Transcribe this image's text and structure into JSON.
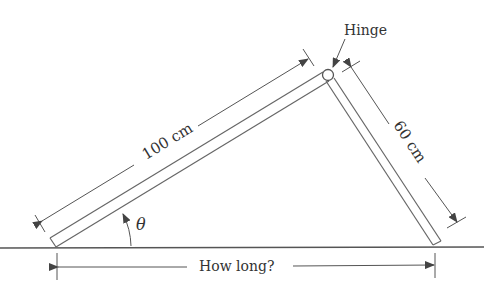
{
  "labels": {
    "hinge": "Hinge",
    "board_long": "100 cm",
    "board_short": "60 cm",
    "angle": "θ",
    "base": "How long?"
  },
  "colors": {
    "line": "#555555",
    "text": "#333333",
    "background": "#ffffff"
  }
}
